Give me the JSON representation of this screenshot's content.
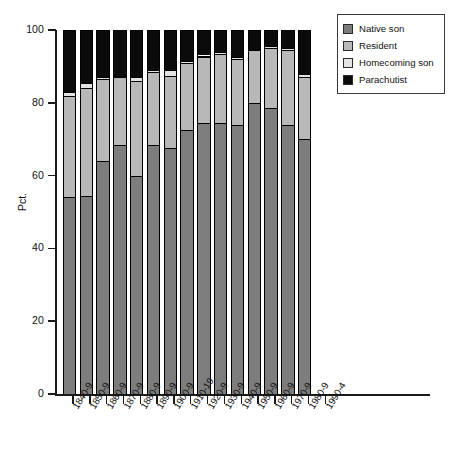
{
  "chart_data": {
    "type": "bar",
    "subtype": "stacked-bar-100",
    "title": "",
    "xlabel": "",
    "ylabel": "Pct.",
    "ylim": [
      0,
      100
    ],
    "yticks": [
      0,
      20,
      40,
      60,
      80,
      100
    ],
    "grid": false,
    "legend_position": "top-right",
    "categories": [
      "1840-9",
      "1850-9",
      "1860-9",
      "1870-9",
      "1880-9",
      "1890-9",
      "1900-9",
      "1910-19",
      "1920-9",
      "1930-9",
      "1940-9",
      "1950-9",
      "1960-9",
      "1970-9",
      "1980-9",
      "1990-4"
    ],
    "series": [
      {
        "name": "Native son",
        "color": "#7d7d7d",
        "values": [
          54,
          54.5,
          64,
          68.5,
          60,
          68.5,
          67.5,
          72.5,
          74.5,
          74.5,
          74,
          80,
          78.5,
          74,
          70,
          null
        ]
      },
      {
        "name": "Resident",
        "color": "#b8b8b8",
        "values": [
          28,
          29.5,
          22.5,
          18.5,
          26,
          20,
          20,
          18.5,
          18,
          19,
          18,
          14.5,
          16.5,
          20.5,
          17,
          null
        ]
      },
      {
        "name": "Homecoming son",
        "color": "#e2e2e2",
        "values": [
          1,
          1.5,
          0.5,
          0.5,
          1,
          0.5,
          1.5,
          0.5,
          0.5,
          0.5,
          0.5,
          0,
          0.5,
          0.5,
          1,
          null
        ]
      },
      {
        "name": "Parachutist",
        "color": "#0b0b0b",
        "values": [
          17,
          14.5,
          13,
          12.5,
          13,
          11,
          11,
          8.5,
          7,
          6,
          7.5,
          5.5,
          4.5,
          5,
          12,
          null
        ]
      }
    ]
  },
  "legend": {
    "items": [
      {
        "label": "Native son",
        "color": "#7d7d7d"
      },
      {
        "label": "Resident",
        "color": "#b8b8b8"
      },
      {
        "label": "Homecoming son",
        "color": "#e2e2e2"
      },
      {
        "label": "Parachutist",
        "color": "#0b0b0b"
      }
    ]
  },
  "axes": {
    "y": {
      "title": "Pct.",
      "ticks": [
        "0",
        "20",
        "40",
        "60",
        "80",
        "100"
      ]
    },
    "x": {
      "ticks": [
        "1840-9",
        "1850-9",
        "1860-9",
        "1870-9",
        "1880-9",
        "1890-9",
        "1900-9",
        "1910-19",
        "1920-9",
        "1930-9",
        "1940-9",
        "1950-9",
        "1960-9",
        "1970-9",
        "1980-9",
        "1990-4"
      ]
    }
  }
}
